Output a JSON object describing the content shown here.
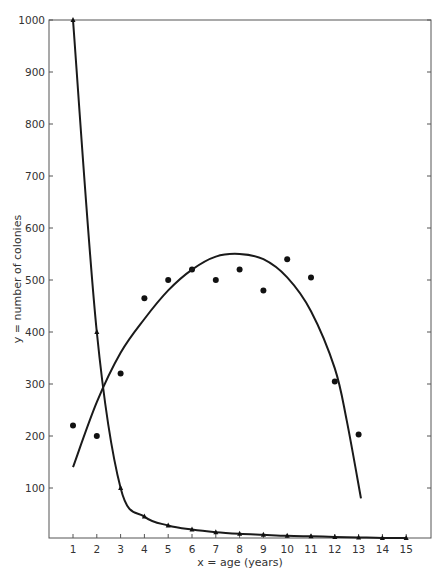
{
  "chart_data": {
    "type": "line",
    "title": "",
    "xlabel": "x = age (years)",
    "ylabel": "y = number of colonies",
    "x_ticks": [
      1,
      2,
      3,
      4,
      5,
      6,
      7,
      8,
      9,
      10,
      11,
      12,
      13,
      14,
      15
    ],
    "y_ticks": [
      100,
      200,
      300,
      400,
      500,
      600,
      700,
      800,
      900,
      1000
    ],
    "xlim": [
      0,
      16
    ],
    "ylim": [
      0,
      1000
    ],
    "grid": false,
    "legend": null,
    "series": [
      {
        "name": "survivorship (triangles)",
        "marker": "triangle",
        "style": "smooth-line",
        "x": [
          1,
          2,
          3,
          4,
          5,
          6,
          7,
          8,
          9,
          10,
          11,
          12,
          13,
          14,
          15
        ],
        "values": [
          1000,
          400,
          100,
          45,
          28,
          20,
          15,
          12,
          10,
          8,
          7,
          6,
          5,
          4,
          4
        ]
      },
      {
        "name": "observed colonies (dots)",
        "marker": "dot",
        "style": "points",
        "x": [
          1,
          2,
          3,
          4,
          5,
          6,
          7,
          8,
          9,
          10,
          11,
          12,
          13
        ],
        "values": [
          220,
          200,
          320,
          465,
          500,
          520,
          500,
          520,
          480,
          540,
          505,
          305,
          203
        ]
      },
      {
        "name": "fitted curve",
        "marker": "none",
        "style": "smooth-line",
        "x": [
          1,
          2,
          3,
          4,
          5,
          6,
          7,
          8,
          9,
          10,
          11,
          12,
          12.5,
          13.1
        ],
        "values": [
          140,
          265,
          360,
          425,
          480,
          520,
          545,
          550,
          540,
          505,
          440,
          330,
          230,
          80
        ]
      }
    ]
  }
}
